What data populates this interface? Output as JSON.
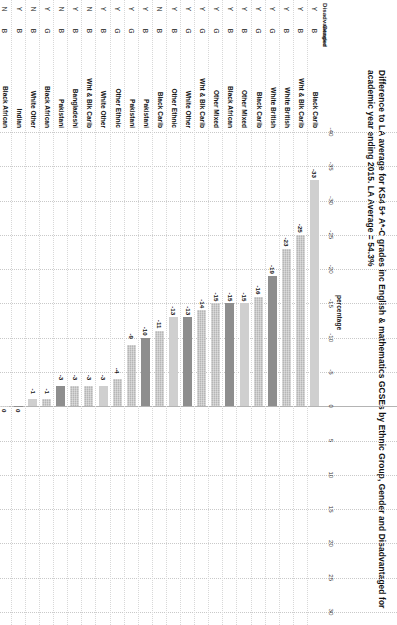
{
  "chart_data": {
    "type": "bar",
    "title": "Difference to LA average for KS4 5+ A*-C grades inc English & mathematics GCSEs by Ethnic Group, Gender and Disadvantaged for academic year ending 2015. LA Average = 54.3%",
    "orientation": "horizontal",
    "xlabel": "percentage",
    "ylabel": "",
    "xlim": [
      -40,
      30
    ],
    "xticks": [
      -40,
      -35,
      -30,
      -25,
      -20,
      -15,
      -10,
      -5,
      0,
      5,
      10,
      15,
      20,
      25,
      30
    ],
    "xtick_labels": [
      "-40",
      "-35",
      "-30",
      "-25",
      "-20",
      "-15",
      "-10",
      "-5",
      "0",
      "5",
      "10",
      "15",
      "20",
      "25",
      "30"
    ],
    "grid": true,
    "legend": "none",
    "column_headers": {
      "disadvantaged": "Disadvantaged",
      "gender": "Gender",
      "ethnic": ""
    },
    "categories": [
      {
        "disadvantaged": "Y",
        "gender": "B",
        "ethnic": "Black Carib",
        "value": -33
      },
      {
        "disadvantaged": "Y",
        "gender": "B",
        "ethnic": "Wht & Blk Carib",
        "value": -25
      },
      {
        "disadvantaged": "Y",
        "gender": "B",
        "ethnic": "White British",
        "value": -23
      },
      {
        "disadvantaged": "Y",
        "gender": "G",
        "ethnic": "White British",
        "value": -19
      },
      {
        "disadvantaged": "Y",
        "gender": "G",
        "ethnic": "Black Carib",
        "value": -16
      },
      {
        "disadvantaged": "Y",
        "gender": "B",
        "ethnic": "Other Mixed",
        "value": -15
      },
      {
        "disadvantaged": "Y",
        "gender": "B",
        "ethnic": "Black African",
        "value": -15
      },
      {
        "disadvantaged": "Y",
        "gender": "G",
        "ethnic": "Other Mixed",
        "value": -15
      },
      {
        "disadvantaged": "Y",
        "gender": "G",
        "ethnic": "Wht & Blk Carib",
        "value": -14
      },
      {
        "disadvantaged": "Y",
        "gender": "G",
        "ethnic": "White Other",
        "value": -13
      },
      {
        "disadvantaged": "Y",
        "gender": "B",
        "ethnic": "Other Ethnic",
        "value": -13
      },
      {
        "disadvantaged": "N",
        "gender": "B",
        "ethnic": "Black Carib",
        "value": -11
      },
      {
        "disadvantaged": "Y",
        "gender": "B",
        "ethnic": "Pakistani",
        "value": -10
      },
      {
        "disadvantaged": "Y",
        "gender": "G",
        "ethnic": "Pakistani",
        "value": -9
      },
      {
        "disadvantaged": "Y",
        "gender": "G",
        "ethnic": "Other Ethnic",
        "value": -4
      },
      {
        "disadvantaged": "Y",
        "gender": "B",
        "ethnic": "White Other",
        "value": -3
      },
      {
        "disadvantaged": "N",
        "gender": "B",
        "ethnic": "Wht & Blk Carib",
        "value": -3
      },
      {
        "disadvantaged": "Y",
        "gender": "B",
        "ethnic": "Bangladeshi",
        "value": -3
      },
      {
        "disadvantaged": "N",
        "gender": "B",
        "ethnic": "Pakistani",
        "value": -3
      },
      {
        "disadvantaged": "Y",
        "gender": "G",
        "ethnic": "Black African",
        "value": -1
      },
      {
        "disadvantaged": "N",
        "gender": "B",
        "ethnic": "White Other",
        "value": -1
      },
      {
        "disadvantaged": "Y",
        "gender": "B",
        "ethnic": "Indian",
        "value": 0
      },
      {
        "disadvantaged": "N",
        "gender": "B",
        "ethnic": "Black African",
        "value": 0
      },
      {
        "disadvantaged": "N",
        "gender": "B",
        "ethnic": "Other Ethnic",
        "value": 1
      },
      {
        "disadvantaged": "N",
        "gender": "G",
        "ethnic": "Pakistani",
        "value": 4
      },
      {
        "disadvantaged": "N",
        "gender": "G",
        "ethnic": "Black Carib",
        "value": 5
      },
      {
        "disadvantaged": "Y",
        "gender": "G",
        "ethnic": "Bangladeshi",
        "value": 6
      },
      {
        "disadvantaged": "Y",
        "gender": "G",
        "ethnic": "Indian",
        "value": 7
      },
      {
        "disadvantaged": "N",
        "gender": "G",
        "ethnic": "Wht & Blk Carib",
        "value": 8
      },
      {
        "disadvantaged": "N",
        "gender": "G",
        "ethnic": "White Other",
        "value": 10
      },
      {
        "disadvantaged": "N",
        "gender": "B",
        "ethnic": "White British",
        "value": 10
      },
      {
        "disadvantaged": "N",
        "gender": "B",
        "ethnic": "Bangladeshi",
        "value": 10
      },
      {
        "disadvantaged": "N",
        "gender": "G",
        "ethnic": "Black African",
        "value": 11
      },
      {
        "disadvantaged": "N",
        "gender": "B",
        "ethnic": "Other Mixed",
        "value": 12
      },
      {
        "disadvantaged": "N",
        "gender": "G",
        "ethnic": "Other Ethnic",
        "value": 13
      },
      {
        "disadvantaged": "N",
        "gender": "G",
        "ethnic": "White British",
        "value": 16
      },
      {
        "disadvantaged": "N",
        "gender": "G",
        "ethnic": "Bangladeshi",
        "value": 18
      },
      {
        "disadvantaged": "N",
        "gender": "B",
        "ethnic": "Indian",
        "value": 21
      },
      {
        "disadvantaged": "N",
        "gender": "G",
        "ethnic": "Indian",
        "value": 21
      },
      {
        "disadvantaged": "N",
        "gender": "G",
        "ethnic": "Other Mixed",
        "value": 27
      }
    ],
    "colors": {
      "bar_default": "#b6b6b6",
      "bar_dark": "#8e8e8e",
      "bar_light": "#cfcfcf",
      "gridline": "#c9c9c9",
      "text": "#111111"
    }
  }
}
